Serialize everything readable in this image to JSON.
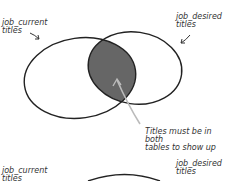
{
  "diagram": {
    "top": {
      "left_label_line1": "job_current",
      "left_label_line2": "titles",
      "right_label_line1": "job_desired",
      "right_label_line2": "titles",
      "annotation_line1": "Titles must be in both",
      "annotation_line2": "tables to show up",
      "intersection_color": "#666666"
    },
    "bottom": {
      "left_label_line1": "job_current",
      "left_label_line2": "titles",
      "right_label_line1": "job_desired",
      "right_label_line2": "titles"
    }
  }
}
